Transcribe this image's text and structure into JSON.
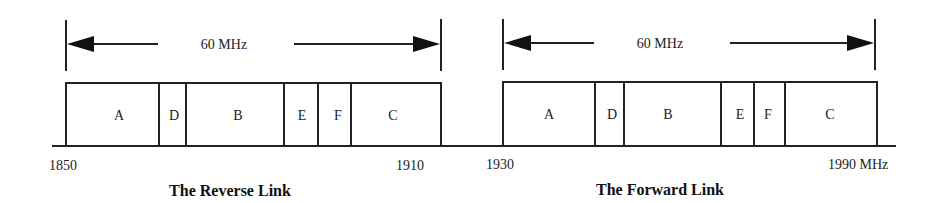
{
  "diagram": {
    "type": "frequency-allocation",
    "links": [
      {
        "title": "The Reverse Link",
        "span_label": "60 MHz",
        "start_label": "1850",
        "end_label": "1910",
        "blocks": [
          {
            "label": "A"
          },
          {
            "label": "D"
          },
          {
            "label": "B"
          },
          {
            "label": "E"
          },
          {
            "label": "F"
          },
          {
            "label": "C"
          }
        ]
      },
      {
        "title": "The Forward Link",
        "span_label": "60 MHz",
        "start_label": "1930",
        "end_label": "1990 MHz",
        "blocks": [
          {
            "label": "A"
          },
          {
            "label": "D"
          },
          {
            "label": "B"
          },
          {
            "label": "E"
          },
          {
            "label": "F"
          },
          {
            "label": "C"
          }
        ]
      }
    ]
  }
}
